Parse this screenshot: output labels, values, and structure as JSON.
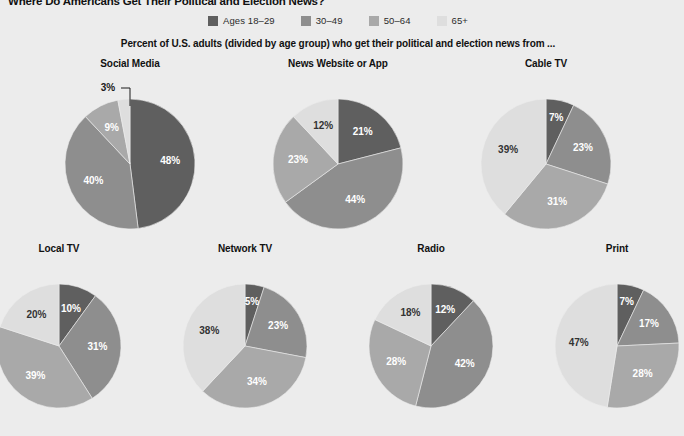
{
  "headline": "Where Do Americans Get Their Political and Election News?",
  "subtitle": "Percent of U.S. adults (divided by age group) who get their political and election news from ...",
  "legend": {
    "items": [
      {
        "label": "Ages 18–29",
        "color": "#5f5f5f"
      },
      {
        "label": "30–49",
        "color": "#8e8e8e"
      },
      {
        "label": "50–64",
        "color": "#a9a9a9"
      },
      {
        "label": "65+",
        "color": "#dedede"
      }
    ]
  },
  "colors": {
    "background": "#ececec",
    "age_18_29": "#5f5f5f",
    "age_30_49": "#8e8e8e",
    "age_50_64": "#a9a9a9",
    "age_65_plus": "#dedede",
    "label_on_dark": "#ffffff",
    "label_on_light": "#333333",
    "text": "#111111"
  },
  "chart_data": {
    "type": "pie",
    "title": "Where Do Americans Get Their Political and Election News?",
    "subtitle": "Percent of U.S. adults (divided by age group) who get their political and election news from ...",
    "legend_position": "top-center",
    "categories": [
      "Ages 18–29",
      "30–49",
      "50–64",
      "65+"
    ],
    "unit": "%",
    "charts": [
      {
        "title": "Social Media",
        "row": "top",
        "values": [
          48,
          40,
          9,
          3
        ],
        "labels": [
          "48%",
          "40%",
          "9%",
          "3%"
        ],
        "callout_index": 3
      },
      {
        "title": "News Website or App",
        "row": "top",
        "values": [
          21,
          44,
          23,
          12
        ],
        "labels": [
          "21%",
          "44%",
          "23%",
          "12%"
        ],
        "callout_index": -1
      },
      {
        "title": "Cable TV",
        "row": "top",
        "values": [
          7,
          23,
          31,
          39
        ],
        "labels": [
          "7%",
          "23%",
          "31%",
          "39%"
        ],
        "callout_index": -1
      },
      {
        "title": "Local TV",
        "row": "bottom",
        "values": [
          10,
          31,
          39,
          20
        ],
        "labels": [
          "10%",
          "31%",
          "39%",
          "20%"
        ],
        "callout_index": -1
      },
      {
        "title": "Network TV",
        "row": "bottom",
        "values": [
          5,
          23,
          34,
          38
        ],
        "labels": [
          "5%",
          "23%",
          "34%",
          "38%"
        ],
        "callout_index": -1
      },
      {
        "title": "Radio",
        "row": "bottom",
        "values": [
          12,
          42,
          28,
          18
        ],
        "labels": [
          "12%",
          "42%",
          "28%",
          "18%"
        ],
        "callout_index": -1
      },
      {
        "title": "Print",
        "row": "bottom",
        "values": [
          7,
          17,
          28,
          47
        ],
        "labels": [
          "7%",
          "17%",
          "28%",
          "47%"
        ],
        "callout_index": -1
      }
    ]
  }
}
